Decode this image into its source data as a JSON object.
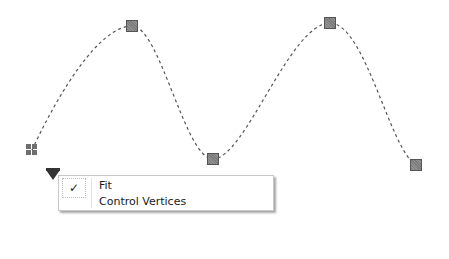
{
  "curve": {
    "style": "dashed",
    "color": "#555555",
    "start_grip": {
      "x": 32,
      "y": 150,
      "icon": "grip-icon"
    },
    "control_points": [
      {
        "x": 132,
        "y": 26
      },
      {
        "x": 213,
        "y": 159
      },
      {
        "x": 330,
        "y": 23
      },
      {
        "x": 416,
        "y": 165
      }
    ]
  },
  "menu": {
    "trigger_icon": "dropdown-triangle-icon",
    "items": [
      {
        "label": "Fit",
        "checked": true,
        "check_glyph": "✓"
      },
      {
        "label": "Control Vertices",
        "checked": false
      }
    ]
  }
}
